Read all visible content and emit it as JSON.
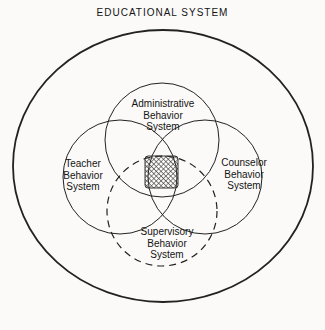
{
  "title": {
    "text": "EDUCATIONAL SYSTEM"
  },
  "venn": {
    "outer_boundary": "Educational System",
    "circles": [
      {
        "name": "Administrative Behavior System",
        "label_lines": [
          "Administrative",
          "Behavior",
          "System"
        ],
        "border": "solid"
      },
      {
        "name": "Teacher Behavior System",
        "label_lines": [
          "Teacher",
          "Behavior",
          "System"
        ],
        "border": "solid"
      },
      {
        "name": "Counselor Behavior System",
        "label_lines": [
          "Counselor",
          "Behavior",
          "System"
        ],
        "border": "solid"
      },
      {
        "name": "Supervisory Behavior System",
        "label_lines": [
          "Supervisory",
          "Behavior",
          "System"
        ],
        "border": "dashed"
      }
    ],
    "center_region": "shaded-intersection-of-all-four-systems"
  },
  "colors": {
    "background": "#fbfaf8",
    "line": "#222222",
    "text": "#141414",
    "hatch": "#3a3a3a"
  }
}
